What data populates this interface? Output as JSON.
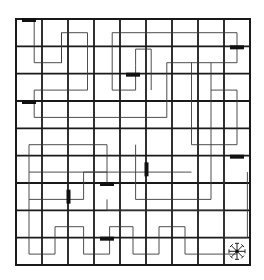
{
  "puzzle": {
    "title": "Maze grid puzzle",
    "grid": {
      "columns": 9,
      "rows": 9
    },
    "colors": {
      "grid": "#1a1a1a",
      "path": "#3a3a3a",
      "block": "#111111",
      "background": "#ffffff"
    },
    "blocks": [
      {
        "name": "block-r1c1",
        "row": 1,
        "col": 1,
        "orientation": "horizontal"
      },
      {
        "name": "block-r2c9",
        "row": 2,
        "col": 9,
        "orientation": "horizontal"
      },
      {
        "name": "block-r3c5",
        "row": 3,
        "col": 5,
        "orientation": "horizontal"
      },
      {
        "name": "block-r4c1",
        "row": 4,
        "col": 1,
        "orientation": "horizontal"
      },
      {
        "name": "block-r6c9",
        "row": 6,
        "col": 9,
        "orientation": "horizontal"
      },
      {
        "name": "block-r6c6",
        "row": 6,
        "col": 6,
        "orientation": "vertical"
      },
      {
        "name": "block-r7c4",
        "row": 7,
        "col": 4,
        "orientation": "horizontal"
      },
      {
        "name": "block-r7c3",
        "row": 7,
        "col": 3,
        "orientation": "vertical"
      },
      {
        "name": "block-r9c4",
        "row": 9,
        "col": 4,
        "orientation": "horizontal"
      }
    ],
    "goal": {
      "row": 9,
      "col": 9,
      "icon": "star-compass-icon",
      "label": "Goal"
    }
  }
}
